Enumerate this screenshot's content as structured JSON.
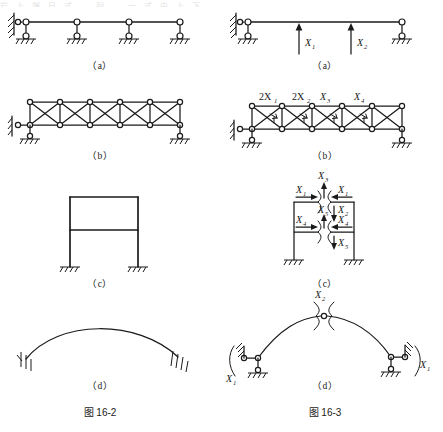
{
  "document": {
    "top_bleed_text": "岩 上 端  日 式 — 列 —  一 式  中  上 下",
    "figures": [
      {
        "id": "fig-16-2",
        "caption": "图 16-2",
        "side": "left",
        "panels": [
          {
            "key": "a",
            "label": "（a）",
            "type": "continuous-beam",
            "spans": 4,
            "labels": []
          },
          {
            "key": "b",
            "label": "（b）",
            "type": "truss",
            "bays": 5,
            "labels": []
          },
          {
            "key": "c",
            "label": "（c）",
            "type": "two-story-frame",
            "stories": 2,
            "labels": []
          },
          {
            "key": "d",
            "label": "（d）",
            "type": "two-hinged-arch",
            "labels": []
          }
        ]
      },
      {
        "id": "fig-16-3",
        "caption": "图 16-3",
        "side": "right",
        "panels": [
          {
            "key": "a",
            "label": "（a）",
            "type": "primary-beam",
            "spans": 4,
            "labels": [
              "X",
              "X"
            ],
            "subs": [
              "1",
              "2"
            ]
          },
          {
            "key": "b",
            "label": "（b）",
            "type": "truss-cut",
            "labels": [
              "2X",
              "2X",
              "X",
              "X"
            ],
            "subs": [
              "1",
              "2",
              "3",
              "4"
            ]
          },
          {
            "key": "c",
            "label": "（c）",
            "type": "frame-cut",
            "labels": [
              "X",
              "X",
              "X",
              "X",
              "X",
              "X",
              "X",
              "X"
            ],
            "subs": [
              "1",
              "3",
              "1",
              "2",
              "4",
              "5",
              "4",
              "5"
            ]
          },
          {
            "key": "d",
            "label": "（d）",
            "type": "arch-cut",
            "labels": [
              "X",
              "X",
              "X"
            ],
            "subs": [
              "2",
              "1",
              "1"
            ]
          }
        ]
      }
    ],
    "symbols": {
      "hinge_node": "circle-hinge-icon",
      "fixed_support": "fixed-support-hatch-icon",
      "roller_support": "roller-support-icon",
      "ground_hatch": "ground-hatch-icon",
      "force_arrow": "force-arrow-icon",
      "cut_bracket": "cut-release-bracket-icon"
    },
    "colors": {
      "ink": "#1a1a1a",
      "paper": "#ffffff"
    }
  }
}
